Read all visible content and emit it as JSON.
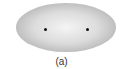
{
  "figure": {
    "caption": "(a)",
    "shape": "ellipse",
    "foci": [
      {
        "label": "focus-1",
        "x": 45,
        "y": 29
      },
      {
        "label": "focus-2",
        "x": 87,
        "y": 29
      }
    ],
    "colors": {
      "ellipse_center": "#f4f4f4",
      "ellipse_edge": "#9a9a9a",
      "focus": "#111111"
    }
  }
}
